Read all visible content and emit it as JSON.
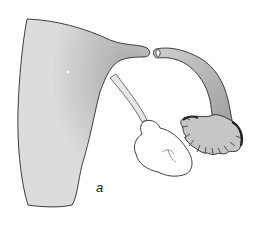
{
  "figure": {
    "label": "a",
    "parts": [
      {
        "id": "uterus-body",
        "description": "large shaded uterine body with horn"
      },
      {
        "id": "ovarian-ligament",
        "description": "thin stalk connecting uterus to ovary"
      },
      {
        "id": "ovary",
        "description": "lobed white ovary"
      },
      {
        "id": "fallopian-tube",
        "description": "curved stippled oviduct"
      },
      {
        "id": "fimbriae",
        "description": "fringed infundibulum"
      }
    ],
    "colors": {
      "fill": "#dcdcdc",
      "stipple": "#555555",
      "outline": "#2a2a2a",
      "ovary_fill": "#ffffff"
    }
  }
}
